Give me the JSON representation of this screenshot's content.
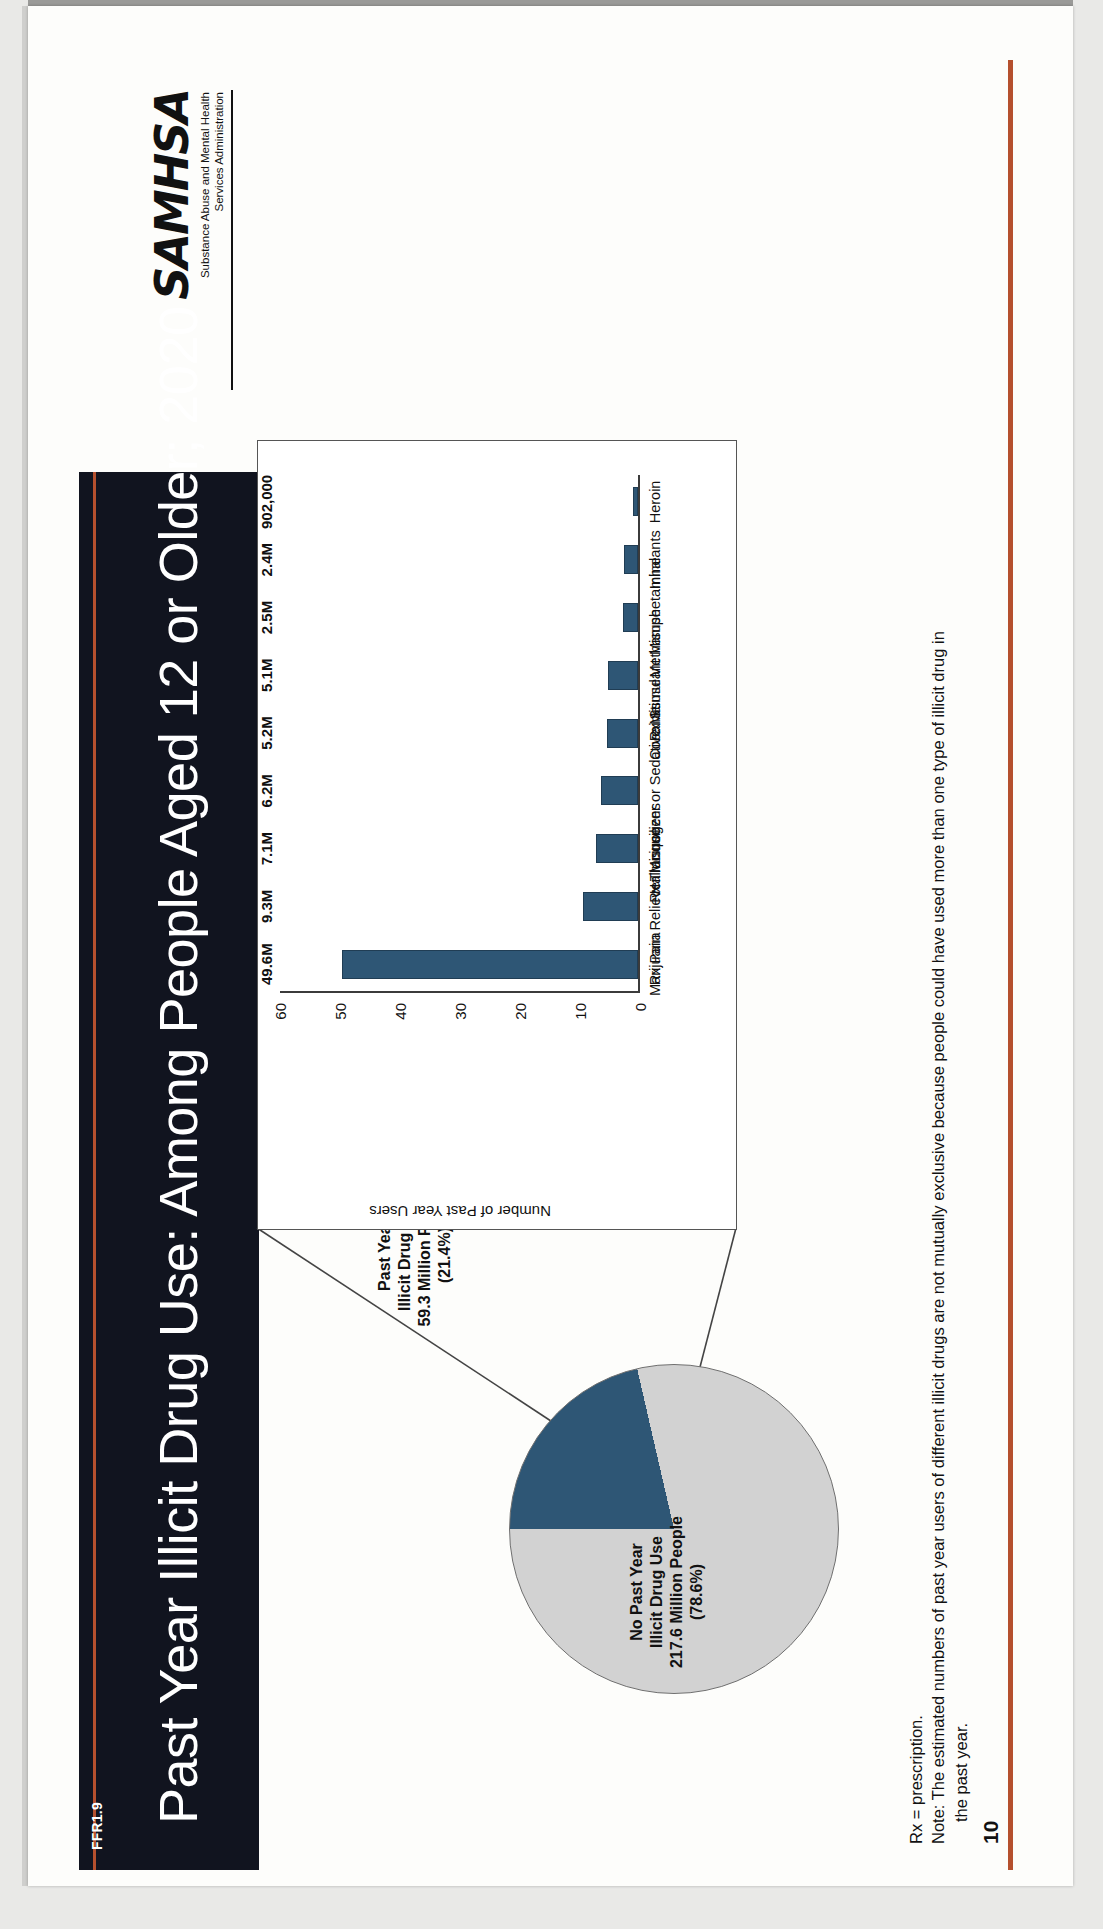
{
  "slide": {
    "figure_id": "FFR1.9",
    "title": "Past Year Illicit Drug Use: Among People Aged 12 or Older; 2020",
    "page_number": "10",
    "accent_color": "#b5502e",
    "title_band_color": "#11141f",
    "series_color": "#2e5675",
    "neutral_color": "#d2d2d2"
  },
  "logo": {
    "wordmark": "SAMHSA",
    "tagline_line1": "Substance Abuse and Mental Health",
    "tagline_line2": "Services Administration"
  },
  "pie": {
    "slices": [
      {
        "name": "no-past-year-illicit-drug-use",
        "label_line1": "No Past Year",
        "label_line2": "Illicit Drug Use",
        "label_line3": "217.6 Million People",
        "label_line4": "(78.6%)",
        "value_millions": 217.6,
        "percent": 78.6,
        "color": "#d2d2d2"
      },
      {
        "name": "past-year-illicit-drug-use",
        "label_line1": "Past Year",
        "label_line2": "Illicit Drug Use",
        "label_line3": "59.3 Million People",
        "label_line4": "(21.4%)",
        "value_millions": 59.3,
        "percent": 21.4,
        "color": "#2e5675"
      }
    ]
  },
  "footnotes": {
    "line1": "Rx = prescription.",
    "line2": "Note: The estimated numbers of past year users of different illicit drugs are not mutually exclusive because people could have used more than one type of illicit drug in",
    "line3": "the past year."
  },
  "chart_data": {
    "type": "bar",
    "title": "",
    "xlabel": "",
    "ylabel": "Number of Past Year Users",
    "ylim": [
      0,
      60
    ],
    "yticks": [
      0,
      10,
      20,
      30,
      40,
      50,
      60
    ],
    "grid": false,
    "legend": "none",
    "orientation": "vertical",
    "units": "millions of people",
    "categories": [
      "Marijuana",
      "Rx Pain Reliever Misuse",
      "Hallucinogens",
      "Rx Tranquilizer or Sedative Misuse",
      "Cocaine",
      "Rx Stimulant Misuse",
      "Methamphetamine",
      "Inhalants",
      "Heroin"
    ],
    "values": [
      49.6,
      9.3,
      7.1,
      6.2,
      5.2,
      5.1,
      2.5,
      2.4,
      0.902
    ],
    "data_labels": [
      "49.6M",
      "9.3M",
      "7.1M",
      "6.2M",
      "5.2M",
      "5.1M",
      "2.5M",
      "2.4M",
      "902,000"
    ]
  }
}
